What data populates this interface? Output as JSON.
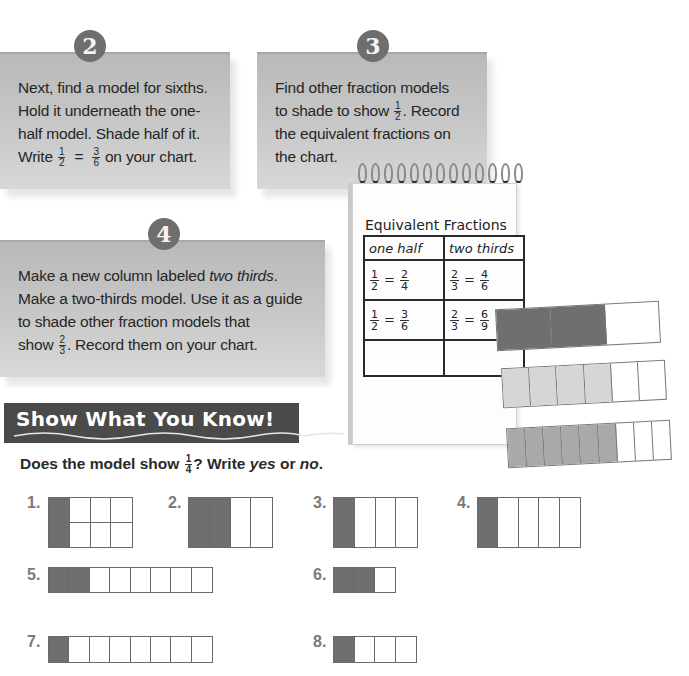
{
  "steps": [
    {
      "number": "2",
      "lines": [
        "Next, find a model for sixths.",
        "Hold it underneath the one-",
        "half model. Shade half of it."
      ],
      "last_line_prefix": "Write",
      "frac_a": {
        "num": "1",
        "den": "2"
      },
      "equals": "=",
      "frac_b": {
        "num": "3",
        "den": "6"
      },
      "last_line_suffix": "on your chart."
    },
    {
      "number": "3",
      "line1": "Find other fraction models",
      "line2_prefix": "to shade to show",
      "frac": {
        "num": "1",
        "den": "2"
      },
      "line2_suffix": ". Record",
      "line3": "the equivalent fractions on",
      "line4": "the chart."
    },
    {
      "number": "4",
      "line1_prefix": "Make a new column labeled ",
      "line1_italic": "two thirds",
      "line1_suffix": ".",
      "line2": "Make a two-thirds model. Use it as a guide",
      "line3": "to shade other fraction models that",
      "line4_prefix": "show",
      "frac": {
        "num": "2",
        "den": "3"
      },
      "line4_suffix": ". Record them on your chart."
    }
  ],
  "notebook": {
    "title": "Equivalent Fractions",
    "headers": [
      "one half",
      "two thirds"
    ],
    "rows": [
      [
        {
          "a": [
            "1",
            "2"
          ],
          "b": [
            "2",
            "4"
          ]
        },
        {
          "a": [
            "2",
            "3"
          ],
          "b": [
            "4",
            "6"
          ]
        }
      ],
      [
        {
          "a": [
            "1",
            "2"
          ],
          "b": [
            "3",
            "6"
          ]
        },
        {
          "a": [
            "2",
            "3"
          ],
          "b": [
            "6",
            "9"
          ]
        }
      ],
      [
        null,
        null
      ]
    ],
    "equals": "="
  },
  "models": [
    {
      "parts": 3,
      "shaded": 2,
      "shade_color": "#6f6f6f"
    },
    {
      "parts": 6,
      "shaded": 4,
      "shade_color": "#d6d6d6"
    },
    {
      "parts": 9,
      "shaded": 6,
      "shade_color": "#a9a9a9"
    }
  ],
  "show_what_you_know": {
    "title": "Show What You Know!",
    "prompt_prefix": "Does the model show",
    "prompt_frac": {
      "num": "1",
      "den": "4"
    },
    "prompt_mid": "? Write ",
    "prompt_yes": "yes",
    "prompt_or": " or ",
    "prompt_no": "no",
    "prompt_end": ".",
    "questions": [
      {
        "label": "1.",
        "rows": 2,
        "cols": 4,
        "shaded_cols": 1
      },
      {
        "label": "2.",
        "rows": 1,
        "cols": 4,
        "shaded_cols": 2
      },
      {
        "label": "3.",
        "rows": 1,
        "cols": 4,
        "shaded_cols": 1
      },
      {
        "label": "4.",
        "rows": 1,
        "cols": 5,
        "shaded_cols": 1
      },
      {
        "label": "5.",
        "rows": 1,
        "cols": 8,
        "shaded_cols": 2
      },
      {
        "label": "6.",
        "rows": 1,
        "cols": 3,
        "shaded_cols": 2
      },
      {
        "label": "7.",
        "rows": 1,
        "cols": 8,
        "shaded_cols": 1
      },
      {
        "label": "8.",
        "rows": 1,
        "cols": 4,
        "shaded_cols": 1
      }
    ]
  }
}
